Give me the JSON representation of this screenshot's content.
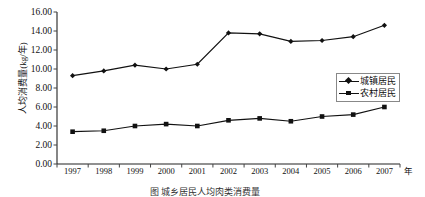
{
  "chart_data": {
    "type": "line",
    "title": "",
    "xlabel": "年",
    "ylabel": "人均消费量(kg/年)",
    "categories": [
      "1997",
      "1998",
      "1999",
      "2000",
      "2001",
      "2002",
      "2003",
      "2004",
      "2005",
      "2006",
      "2007"
    ],
    "x": [
      1997,
      1998,
      1999,
      2000,
      2001,
      2002,
      2003,
      2004,
      2005,
      2006,
      2007
    ],
    "ylim": [
      0.0,
      16.0
    ],
    "ytick_step": 2.0,
    "ytick_labels": [
      "16.00",
      "14.00",
      "12.00",
      "10.00",
      "8.00",
      "6.00",
      "4.00",
      "2.00",
      "0.00"
    ],
    "ytick_values": [
      16.0,
      14.0,
      12.0,
      10.0,
      8.0,
      6.0,
      4.0,
      2.0,
      0.0
    ],
    "grid": false,
    "legend_position": "right",
    "series": [
      {
        "name": "城镇居民",
        "marker": "diamond",
        "color": "#111111",
        "values": [
          9.3,
          9.8,
          10.4,
          10.0,
          10.5,
          13.8,
          13.7,
          12.9,
          13.0,
          13.4,
          14.6
        ]
      },
      {
        "name": "农村居民",
        "marker": "square",
        "color": "#111111",
        "values": [
          3.4,
          3.5,
          4.0,
          4.2,
          4.0,
          4.6,
          4.8,
          4.5,
          5.0,
          5.2,
          6.0
        ]
      }
    ]
  },
  "legend": {
    "items": [
      {
        "label": "城镇居民",
        "marker": "diamond"
      },
      {
        "label": "农村居民",
        "marker": "square"
      }
    ]
  },
  "caption": {
    "text": "图 城乡居民人均肉类消费量"
  }
}
